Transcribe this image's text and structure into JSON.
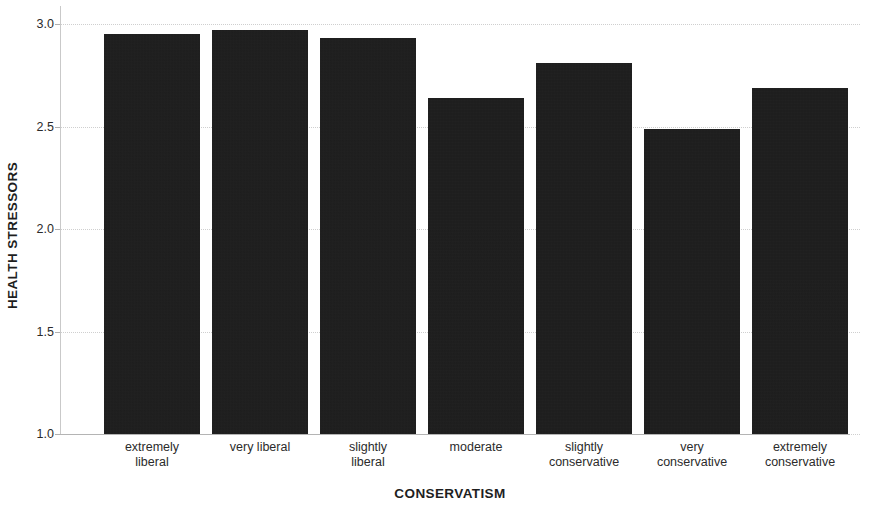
{
  "chart_data": {
    "type": "bar",
    "title": "",
    "subtitle": "",
    "xlabel": "CONSERVATISM",
    "ylabel": "HEALTH STRESSORS",
    "categories": [
      "extremely liberal",
      "very liberal",
      "slightly liberal",
      "moderate",
      "slightly conservative",
      "very conservative",
      "extremely conservative"
    ],
    "category_lines": [
      [
        "extremely",
        "liberal"
      ],
      [
        "very liberal"
      ],
      [
        "slightly",
        "liberal"
      ],
      [
        "moderate"
      ],
      [
        "slightly",
        "conservative"
      ],
      [
        "very",
        "conservative"
      ],
      [
        "extremely",
        "conservative"
      ]
    ],
    "values": [
      2.95,
      2.97,
      2.93,
      2.64,
      2.81,
      2.49,
      2.69
    ],
    "ylim": [
      1.0,
      3.0
    ],
    "ytick_labels": [
      "3.0",
      "2.5",
      "2.0",
      "1.5",
      "1.0"
    ],
    "ytick_values": [
      3.0,
      2.5,
      2.0,
      1.5,
      1.0
    ],
    "grid": true,
    "legend": "none",
    "bar_color": "#151515",
    "gridline_color": "#cfcfcf",
    "axis_color": "#b4b4b4",
    "background_color": "#ffffff"
  }
}
